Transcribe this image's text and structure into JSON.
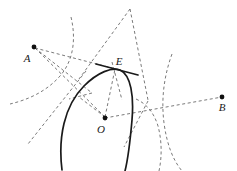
{
  "figure": {
    "type": "geometry-construction-diagram",
    "width": 237,
    "height": 171,
    "background_color": "#ffffff",
    "solid_stroke_color": "#1a1a1a",
    "dashed_stroke_color": "#6b6b6b",
    "label_color": "#1a1a1a"
  },
  "labels": [
    {
      "name": "label-A",
      "text": "A",
      "x": 27,
      "y": 59
    },
    {
      "name": "label-E",
      "text": "E",
      "x": 119,
      "y": 62
    },
    {
      "name": "label-O",
      "text": "O",
      "x": 101,
      "y": 130
    },
    {
      "name": "label-B",
      "text": "B",
      "x": 222,
      "y": 108
    }
  ],
  "points": [
    {
      "name": "point-A",
      "label": "A",
      "x": 34,
      "y": 47,
      "radius": 2.4
    },
    {
      "name": "point-O",
      "label": "O",
      "x": 105,
      "y": 118,
      "radius": 2.4
    },
    {
      "name": "point-B",
      "label": "B",
      "x": 222,
      "y": 97,
      "radius": 2.4
    },
    {
      "name": "point-E",
      "label": "E",
      "x": 114,
      "y": 70,
      "radius": 0
    }
  ],
  "solid_curves": [
    {
      "name": "circle-arc-O",
      "description": "main circle arc centered at O passing through E",
      "path": "M 62 170 C 58 138 64 106 84 86 C 98 72 112 67 120 70 C 131 75 134 96 132 120 C 130 143 128 159 125 171"
    }
  ],
  "tangent_lines": [
    {
      "name": "tangent-at-E",
      "description": "tangent segment touching the circle at E",
      "x1": 96,
      "y1": 64,
      "x2": 138,
      "y2": 75
    }
  ],
  "dashed_curves": [
    {
      "name": "dashed-arc-left-upper",
      "description": "construction arc from top sweeping down to the left edge",
      "path": "M 71 17 C 76 38 74 60 60 76 C 46 92 27 100 10 104"
    },
    {
      "name": "dashed-arc-right-outer",
      "description": "construction arc on the right sweeping from top-right down to bottom",
      "path": "M 172 54 C 164 76 161 99 164 123 C 167 145 173 160 182 171"
    },
    {
      "name": "dashed-arc-right-inner",
      "description": "short construction arc right of the circle",
      "path": "M 136 99 C 147 104 154 113 158 126 C 162 141 162 157 159 171"
    }
  ],
  "dashed_lines": [
    {
      "name": "dashed-line-A-to-E",
      "x1": 35,
      "y1": 48,
      "x2": 116,
      "y2": 69
    },
    {
      "name": "dashed-line-A-to-O",
      "x1": 35,
      "y1": 48,
      "x2": 105,
      "y2": 117
    },
    {
      "name": "dashed-line-A-to-node-right",
      "x1": 35,
      "y1": 48,
      "x2": 92,
      "y2": 93
    },
    {
      "name": "dashed-line-O-to-E",
      "x1": 105,
      "y1": 117,
      "x2": 115,
      "y2": 69
    },
    {
      "name": "dashed-line-O-to-B",
      "x1": 105,
      "y1": 118,
      "x2": 222,
      "y2": 97
    },
    {
      "name": "dashed-line-O-to-upleft",
      "x1": 105,
      "y1": 117,
      "x2": 79,
      "y2": 97
    },
    {
      "name": "dashed-line-peak-left",
      "x1": 130,
      "y1": 9,
      "x2": 79,
      "y2": 79
    },
    {
      "name": "dashed-line-peak-right",
      "x1": 130,
      "y1": 9,
      "x2": 148,
      "y2": 100
    },
    {
      "name": "dashed-line-lower-left",
      "x1": 86,
      "y1": 71,
      "x2": 28,
      "y2": 144
    },
    {
      "name": "dashed-line-node-to-bottomright",
      "x1": 148,
      "y1": 101,
      "x2": 124,
      "y2": 147
    },
    {
      "name": "dashed-line-E-through-down",
      "x1": 112,
      "y1": 62,
      "x2": 122,
      "y2": 100
    },
    {
      "name": "dashed-line-node-left-short",
      "x1": 92,
      "y1": 93,
      "x2": 69,
      "y2": 99
    }
  ]
}
